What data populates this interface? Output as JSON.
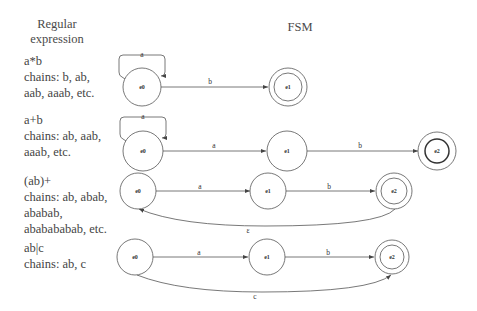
{
  "headers": {
    "regex": "Regular expression",
    "regex_line1": "Regular",
    "regex_line2": "expression",
    "fsm": "FSM"
  },
  "rows": [
    {
      "expression": "a*b",
      "chains_lines": [
        "chains: b, ab,",
        "aab, aaab, etc."
      ],
      "fsm": {
        "states": [
          {
            "id": "e0",
            "label": "e0",
            "accepting": false
          },
          {
            "id": "e1",
            "label": "e1",
            "accepting": true
          }
        ],
        "transitions": [
          {
            "from": "e0",
            "to": "e0",
            "label": "a",
            "type": "self-loop"
          },
          {
            "from": "e0",
            "to": "e1",
            "label": "b"
          }
        ]
      }
    },
    {
      "expression": "a+b",
      "chains_lines": [
        "chains: ab, aab,",
        "aaab, etc."
      ],
      "fsm": {
        "states": [
          {
            "id": "e0",
            "label": "e0",
            "accepting": false
          },
          {
            "id": "e1",
            "label": "e1",
            "accepting": false
          },
          {
            "id": "e2",
            "label": "e2",
            "accepting": true
          }
        ],
        "transitions": [
          {
            "from": "e0",
            "to": "e0",
            "label": "a",
            "type": "self-loop"
          },
          {
            "from": "e0",
            "to": "e1",
            "label": "a"
          },
          {
            "from": "e1",
            "to": "e2",
            "label": "b"
          }
        ]
      }
    },
    {
      "expression": "(ab)+",
      "chains_lines": [
        "chains: ab, abab,",
        "ababab,",
        "ababababab, etc."
      ],
      "fsm": {
        "states": [
          {
            "id": "e0",
            "label": "e0",
            "accepting": false
          },
          {
            "id": "e1",
            "label": "e1",
            "accepting": false
          },
          {
            "id": "e2",
            "label": "e2",
            "accepting": true
          }
        ],
        "transitions": [
          {
            "from": "e0",
            "to": "e1",
            "label": "a"
          },
          {
            "from": "e1",
            "to": "e2",
            "label": "b"
          },
          {
            "from": "e2",
            "to": "e0",
            "label": "ε",
            "type": "curved-back"
          }
        ]
      }
    },
    {
      "expression": "ab|c",
      "chains_lines": [
        "chains: ab, c"
      ],
      "fsm": {
        "states": [
          {
            "id": "e0",
            "label": "e0",
            "accepting": false
          },
          {
            "id": "e1",
            "label": "e1",
            "accepting": false
          },
          {
            "id": "e2",
            "label": "e2",
            "accepting": true
          }
        ],
        "transitions": [
          {
            "from": "e0",
            "to": "e1",
            "label": "a"
          },
          {
            "from": "e1",
            "to": "e2",
            "label": "b"
          },
          {
            "from": "e0",
            "to": "e2",
            "label": "c",
            "type": "curved-below"
          }
        ]
      }
    }
  ]
}
